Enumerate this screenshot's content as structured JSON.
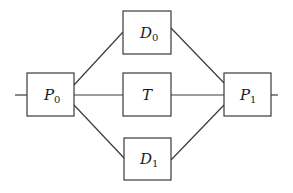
{
  "diagram": {
    "type": "flow-network",
    "nodes": [
      {
        "id": "P0",
        "label": "P",
        "subscript": "0",
        "x": 27,
        "y": 73,
        "w": 47,
        "h": 43
      },
      {
        "id": "D0",
        "label": "D",
        "subscript": "0",
        "x": 123,
        "y": 11,
        "w": 48,
        "h": 43
      },
      {
        "id": "T",
        "label": "T",
        "subscript": "",
        "x": 123,
        "y": 73,
        "w": 48,
        "h": 43
      },
      {
        "id": "D1",
        "label": "D",
        "subscript": "1",
        "x": 124,
        "y": 138,
        "w": 47,
        "h": 42
      },
      {
        "id": "P1",
        "label": "P",
        "subscript": "1",
        "x": 224,
        "y": 73,
        "w": 47,
        "h": 43
      }
    ],
    "edges": [
      {
        "from": "input",
        "to": "P0"
      },
      {
        "from": "P0",
        "to": "D0"
      },
      {
        "from": "P0",
        "to": "T"
      },
      {
        "from": "P0",
        "to": "D1"
      },
      {
        "from": "D0",
        "to": "P1"
      },
      {
        "from": "T",
        "to": "P1"
      },
      {
        "from": "D1",
        "to": "P1"
      },
      {
        "from": "P1",
        "to": "output"
      }
    ]
  }
}
